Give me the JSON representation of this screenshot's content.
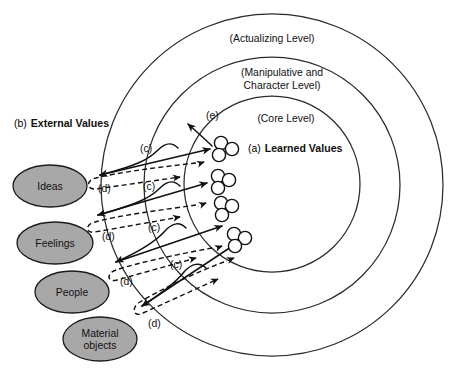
{
  "diagram": {
    "background_color": "#ffffff",
    "line_color": "#111111",
    "ellipse_fill": "#a8a8a8",
    "node_fill": "#ffffff"
  },
  "rings": [
    {
      "id": "actualizing",
      "label": "(Actualizing Level)",
      "cx": 272,
      "cy": 185,
      "r": 171,
      "label_x": 272,
      "label_y": 42
    },
    {
      "id": "manipulative",
      "label_line1": "(Manipulative and",
      "label_line2": "Character Level)",
      "cx": 272,
      "cy": 185,
      "r": 128,
      "label_x": 282,
      "label_y": 76
    },
    {
      "id": "core",
      "label": "(Core Level)",
      "cx": 272,
      "cy": 184,
      "r": 88,
      "label_x": 286,
      "label_y": 122
    }
  ],
  "center_label": {
    "prefix": "(a)",
    "text": "Learned Values",
    "x": 248,
    "y": 152
  },
  "external_label": {
    "prefix": "(b)",
    "text": "External Values",
    "x": 14,
    "y": 127
  },
  "sources": [
    {
      "id": "ideas",
      "label": "Ideas",
      "cx": 50,
      "cy": 186,
      "rx": 37,
      "ry": 21
    },
    {
      "id": "feelings",
      "label": "Feelings",
      "cx": 55,
      "cy": 243,
      "rx": 38,
      "ry": 21
    },
    {
      "id": "people",
      "label": "People",
      "cx": 72,
      "cy": 292,
      "rx": 37,
      "ry": 21
    },
    {
      "id": "material",
      "label_line1": "Material",
      "label_line2": "objects",
      "cx": 100,
      "cy": 339,
      "rx": 37,
      "ry": 22
    }
  ],
  "value_clusters": [
    {
      "id": "cluster-1",
      "cx": 222,
      "cy": 148
    },
    {
      "id": "cluster-2",
      "cx": 218,
      "cy": 182
    },
    {
      "id": "cluster-3",
      "cx": 217,
      "cy": 209
    },
    {
      "id": "cluster-4",
      "cx": 233,
      "cy": 240
    }
  ],
  "flow_tags": [
    {
      "id": "tag-e",
      "label": "(e)",
      "x": 206,
      "y": 119
    },
    {
      "id": "tag-c1",
      "label": "(c)",
      "x": 140,
      "y": 152
    },
    {
      "id": "tag-d1",
      "label": "(d)",
      "x": 98,
      "y": 192
    },
    {
      "id": "tag-c2",
      "label": "(c)",
      "x": 143,
      "y": 190
    },
    {
      "id": "tag-d2",
      "label": "(d)",
      "x": 102,
      "y": 240
    },
    {
      "id": "tag-c3",
      "label": "(c)",
      "x": 148,
      "y": 231
    },
    {
      "id": "tag-d3",
      "label": "(d)",
      "x": 120,
      "y": 285
    },
    {
      "id": "tag-c4",
      "label": "(c)",
      "x": 170,
      "y": 268
    },
    {
      "id": "tag-d4",
      "label": "(d)",
      "x": 148,
      "y": 327
    }
  ],
  "legend_semantics": {
    "a": "Learned Values (core inner values)",
    "b": "External Values (ideas, feelings, people, material objects)",
    "c": "Inbound solid flow from external source into learned value",
    "d": "Outbound dashed return flow from learned value to external source",
    "e": "Outward expression beyond the core level"
  }
}
